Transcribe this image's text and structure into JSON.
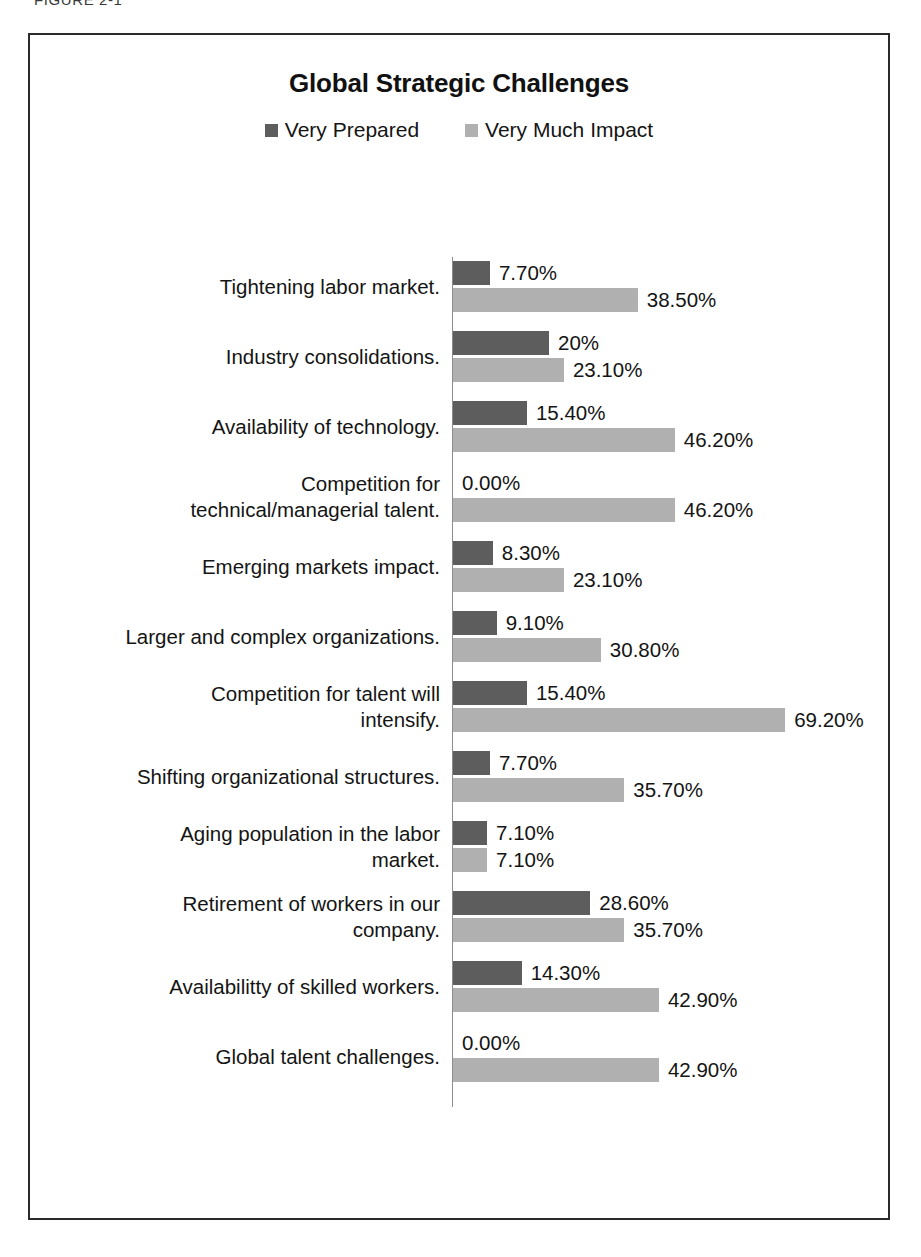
{
  "figure": {
    "caption": "FIGURE 2-1"
  },
  "chart": {
    "title": "Global Strategic Challenges",
    "legend": [
      {
        "label": "Very Prepared",
        "color": "#5d5d5d",
        "swatch_icon": "square-swatch-icon"
      },
      {
        "label": "Very Much Impact",
        "color": "#b0b0b0",
        "swatch_icon": "square-swatch-icon"
      }
    ]
  },
  "chart_data": {
    "type": "bar",
    "orientation": "horizontal",
    "title": "Global Strategic Challenges",
    "xlabel": "",
    "ylabel": "",
    "xlim": [
      0,
      70
    ],
    "grid": false,
    "legend_position": "top-center",
    "categories": [
      "Tightening labor market.",
      "Industry consolidations.",
      "Availability of technology.",
      "Competition for technical/managerial talent.",
      "Emerging markets impact.",
      "Larger and complex organizations.",
      "Competition for talent will intensify.",
      "Shifting organizational structures.",
      "Aging population in the labor market.",
      "Retirement of workers in  our company.",
      "Availabilitty of skilled workers.",
      "Global talent challenges."
    ],
    "series": [
      {
        "name": "Very Prepared",
        "color": "#5d5d5d",
        "values": [
          7.7,
          20,
          15.4,
          0.0,
          8.3,
          9.1,
          15.4,
          7.7,
          7.1,
          28.6,
          14.3,
          0.0
        ],
        "labels": [
          "7.70%",
          "20%",
          "15.40%",
          "0.00%",
          "8.30%",
          "9.10%",
          "15.40%",
          "7.70%",
          "7.10%",
          "28.60%",
          "14.30%",
          "0.00%"
        ]
      },
      {
        "name": "Very Much Impact",
        "color": "#b0b0b0",
        "values": [
          38.5,
          23.1,
          46.2,
          46.2,
          23.1,
          30.8,
          69.2,
          35.7,
          7.1,
          35.7,
          42.9,
          42.9
        ],
        "labels": [
          "38.50%",
          "23.10%",
          "46.20%",
          "46.20%",
          "23.10%",
          "30.80%",
          "69.20%",
          "35.70%",
          "7.10%",
          "35.70%",
          "42.90%",
          "42.90%"
        ]
      }
    ]
  },
  "rows": [
    {
      "label_lines": [
        "Tightening labor market."
      ],
      "prepared": {
        "value": 7.7,
        "label": "7.70%"
      },
      "impact": {
        "value": 38.5,
        "label": "38.50%"
      }
    },
    {
      "label_lines": [
        "Industry consolidations."
      ],
      "prepared": {
        "value": 20,
        "label": "20%"
      },
      "impact": {
        "value": 23.1,
        "label": "23.10%"
      }
    },
    {
      "label_lines": [
        "Availability of technology."
      ],
      "prepared": {
        "value": 15.4,
        "label": "15.40%"
      },
      "impact": {
        "value": 46.2,
        "label": "46.20%"
      }
    },
    {
      "label_lines": [
        "Competition for",
        "technical/managerial talent."
      ],
      "prepared": {
        "value": 0,
        "label": "0.00%"
      },
      "impact": {
        "value": 46.2,
        "label": "46.20%"
      }
    },
    {
      "label_lines": [
        "Emerging markets impact."
      ],
      "prepared": {
        "value": 8.3,
        "label": "8.30%"
      },
      "impact": {
        "value": 23.1,
        "label": "23.10%"
      }
    },
    {
      "label_lines": [
        "Larger and complex organizations."
      ],
      "prepared": {
        "value": 9.1,
        "label": "9.10%"
      },
      "impact": {
        "value": 30.8,
        "label": "30.80%"
      }
    },
    {
      "label_lines": [
        "Competition for talent will",
        "intensify."
      ],
      "prepared": {
        "value": 15.4,
        "label": "15.40%"
      },
      "impact": {
        "value": 69.2,
        "label": "69.20%"
      }
    },
    {
      "label_lines": [
        "Shifting organizational structures."
      ],
      "prepared": {
        "value": 7.7,
        "label": "7.70%"
      },
      "impact": {
        "value": 35.7,
        "label": "35.70%"
      }
    },
    {
      "label_lines": [
        "Aging population in the labor",
        "market."
      ],
      "prepared": {
        "value": 7.1,
        "label": "7.10%"
      },
      "impact": {
        "value": 7.1,
        "label": "7.10%"
      }
    },
    {
      "label_lines": [
        "Retirement of workers in  our",
        "company."
      ],
      "prepared": {
        "value": 28.6,
        "label": "28.60%"
      },
      "impact": {
        "value": 35.7,
        "label": "35.70%"
      }
    },
    {
      "label_lines": [
        "Availabilitty of skilled workers."
      ],
      "prepared": {
        "value": 14.3,
        "label": "14.30%"
      },
      "impact": {
        "value": 42.9,
        "label": "42.90%"
      }
    },
    {
      "label_lines": [
        "Global talent challenges."
      ],
      "prepared": {
        "value": 0,
        "label": "0.00%"
      },
      "impact": {
        "value": 42.9,
        "label": "42.90%"
      }
    }
  ]
}
